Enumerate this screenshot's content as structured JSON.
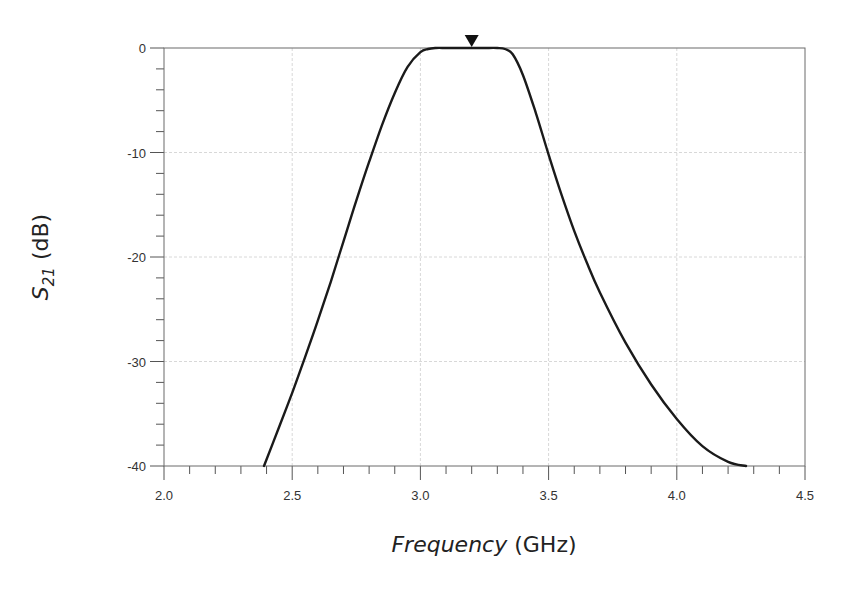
{
  "chart_data": {
    "type": "line",
    "title": "",
    "xlabel": "Frequency (GHz)",
    "xlabel_parts": {
      "italic": "Frequency",
      "normal": " (GHz)"
    },
    "ylabel": "S21 (dB)",
    "ylabel_parts": {
      "base": "S",
      "sub": "21",
      "normal": " (dB)"
    },
    "xlim": [
      2.0,
      4.5
    ],
    "ylim": [
      -40,
      0
    ],
    "x_ticks": [
      "2.0",
      "2.5",
      "3.0",
      "3.5",
      "4.0",
      "4.5"
    ],
    "x_tick_values": [
      2.0,
      2.5,
      3.0,
      3.5,
      4.0,
      4.5
    ],
    "y_ticks": [
      "0",
      "-10",
      "-20",
      "-30",
      "-40"
    ],
    "y_tick_values": [
      0,
      -10,
      -20,
      -30,
      -40
    ],
    "grid": true,
    "legend": null,
    "marker": {
      "type": "triangle-down",
      "x": 3.2,
      "y": 0
    },
    "series": [
      {
        "name": "S21",
        "color": "#1a1a1a",
        "x": [
          2.39,
          2.45,
          2.5,
          2.55,
          2.6,
          2.65,
          2.7,
          2.75,
          2.8,
          2.85,
          2.9,
          2.95,
          3.0,
          3.03,
          3.06,
          3.1,
          3.15,
          3.2,
          3.25,
          3.3,
          3.33,
          3.36,
          3.4,
          3.45,
          3.5,
          3.55,
          3.6,
          3.65,
          3.7,
          3.8,
          3.9,
          4.0,
          4.1,
          4.2,
          4.27
        ],
        "values": [
          -40,
          -36.2,
          -33.0,
          -29.6,
          -26.1,
          -22.4,
          -18.5,
          -14.6,
          -10.9,
          -7.4,
          -4.3,
          -1.8,
          -0.4,
          -0.1,
          0,
          0,
          0,
          0,
          0,
          0,
          -0.1,
          -0.6,
          -2.6,
          -6.2,
          -10.2,
          -14.0,
          -17.5,
          -20.6,
          -23.4,
          -28.2,
          -32.2,
          -35.5,
          -38.1,
          -39.6,
          -40
        ]
      }
    ]
  }
}
